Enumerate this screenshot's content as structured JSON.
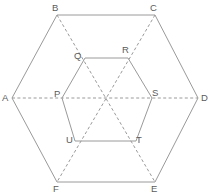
{
  "figure": {
    "name": "hexagon-with-inscribed-hexagon",
    "background_color": "#ffffff",
    "stroke_color": "#9a9a9a",
    "label_color": "#5a5a5a",
    "outer_polygon": {
      "name": "outer-hexagon",
      "label": "ABCDEF",
      "line_style": "solid",
      "points": "12,98 57,15 155,15 198,98 155,182 57,182"
    },
    "inner_polygon": {
      "name": "inner-hexagon",
      "label": "PQRSTU",
      "line_style": "solid",
      "points": "62,98 85,58 128,58 152,98 136,141 75,141"
    },
    "diagonals": [
      {
        "name": "diagonal-A-D",
        "from": "A",
        "to": "D",
        "line_style": "dashed",
        "x1": 12,
        "y1": 98,
        "x2": 198,
        "y2": 98
      },
      {
        "name": "diagonal-B-E",
        "from": "B",
        "to": "E",
        "line_style": "dashed",
        "x1": 57,
        "y1": 15,
        "x2": 155,
        "y2": 182
      },
      {
        "name": "diagonal-C-F",
        "from": "C",
        "to": "F",
        "line_style": "dashed",
        "x1": 155,
        "y1": 15,
        "x2": 57,
        "y2": 182
      }
    ],
    "center": {
      "name": "center-point",
      "x": 106,
      "y": 98,
      "label": ""
    },
    "vertices": [
      {
        "name": "vertex-A",
        "label": "A",
        "point_x": 12,
        "point_y": 98,
        "label_x": 2,
        "label_y": 93
      },
      {
        "name": "vertex-B",
        "label": "B",
        "point_x": 57,
        "point_y": 15,
        "label_x": 52,
        "label_y": 3
      },
      {
        "name": "vertex-C",
        "label": "C",
        "point_x": 155,
        "point_y": 15,
        "label_x": 150,
        "label_y": 3
      },
      {
        "name": "vertex-D",
        "label": "D",
        "point_x": 198,
        "point_y": 98,
        "label_x": 201,
        "label_y": 93
      },
      {
        "name": "vertex-E",
        "label": "E",
        "point_x": 155,
        "point_y": 182,
        "label_x": 151,
        "label_y": 184
      },
      {
        "name": "vertex-F",
        "label": "F",
        "point_x": 57,
        "point_y": 182,
        "label_x": 53,
        "label_y": 184
      },
      {
        "name": "vertex-P",
        "label": "P",
        "point_x": 62,
        "point_y": 98,
        "label_x": 54,
        "label_y": 89
      },
      {
        "name": "vertex-Q",
        "label": "Q",
        "point_x": 85,
        "point_y": 58,
        "label_x": 74,
        "label_y": 51
      },
      {
        "name": "vertex-R",
        "label": "R",
        "point_x": 128,
        "point_y": 58,
        "label_x": 122,
        "label_y": 45
      },
      {
        "name": "vertex-S",
        "label": "S",
        "point_x": 152,
        "point_y": 98,
        "label_x": 152,
        "label_y": 88
      },
      {
        "name": "vertex-T",
        "label": "T",
        "point_x": 136,
        "point_y": 141,
        "label_x": 136,
        "label_y": 135
      },
      {
        "name": "vertex-U",
        "label": "U",
        "point_x": 75,
        "point_y": 141,
        "label_x": 66,
        "label_y": 135
      }
    ]
  }
}
